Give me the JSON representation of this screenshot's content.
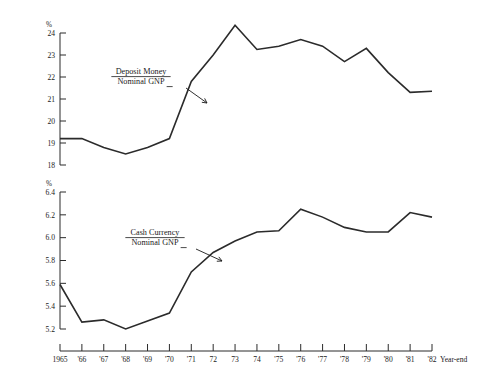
{
  "figure": {
    "x_axis_caption": "Year-end",
    "x_tick_labels": [
      "1965",
      "'66",
      "'67",
      "'68",
      "'69",
      "'70",
      "'71",
      "72",
      "73",
      "74",
      "'75",
      "'76",
      "'77",
      "'78",
      "'79",
      "'80",
      "'81",
      "'82"
    ],
    "ink_color": "#2b2b2b",
    "background_color": "#ffffff"
  },
  "chart_data": [
    {
      "type": "line",
      "title": "",
      "panel": "top",
      "annotation_numerator": "Deposit Money",
      "annotation_denominator": "Nominal GNP",
      "unit_label": "%",
      "xlabel": "Year-end",
      "ylabel": "%",
      "ylim": [
        18,
        24
      ],
      "ytick_labels": [
        "18",
        "19",
        "20",
        "21",
        "22",
        "23",
        "24"
      ],
      "yticks": [
        18,
        19,
        20,
        21,
        22,
        23,
        24
      ],
      "grid": false,
      "legend": "annotation-with-arrow",
      "categories": [
        "1965",
        "'66",
        "'67",
        "'68",
        "'69",
        "'70",
        "'71",
        "72",
        "73",
        "74",
        "'75",
        "'76",
        "'77",
        "'78",
        "'79",
        "'80",
        "'81",
        "'82"
      ],
      "x": [
        1965,
        1966,
        1967,
        1968,
        1969,
        1970,
        1971,
        1972,
        1973,
        1974,
        1975,
        1976,
        1977,
        1978,
        1979,
        1980,
        1981,
        1982
      ],
      "values": [
        19.2,
        19.2,
        18.8,
        18.5,
        18.8,
        19.2,
        21.8,
        23.0,
        24.35,
        23.25,
        23.4,
        23.7,
        23.4,
        22.7,
        23.3,
        22.2,
        21.3,
        21.35
      ]
    },
    {
      "type": "line",
      "title": "",
      "panel": "bottom",
      "annotation_numerator": "Cash Currency",
      "annotation_denominator": "Nominal GNP",
      "unit_label": "%",
      "xlabel": "Year-end",
      "ylabel": "%",
      "ylim": [
        5.2,
        6.4
      ],
      "ytick_labels": [
        "5.2",
        "5.4",
        "5.6",
        "5.8",
        "6.0",
        "6.2",
        "6.4"
      ],
      "yticks": [
        5.2,
        5.4,
        5.6,
        5.8,
        6.0,
        6.2,
        6.4
      ],
      "grid": false,
      "legend": "annotation-with-arrow",
      "categories": [
        "1965",
        "'66",
        "'67",
        "'68",
        "'69",
        "'70",
        "'71",
        "72",
        "73",
        "74",
        "'75",
        "'76",
        "'77",
        "'78",
        "'79",
        "'80",
        "'81",
        "'82"
      ],
      "x": [
        1965,
        1966,
        1967,
        1968,
        1969,
        1970,
        1971,
        1972,
        1973,
        1974,
        1975,
        1976,
        1977,
        1978,
        1979,
        1980,
        1981,
        1982
      ],
      "values": [
        5.59,
        5.26,
        5.28,
        5.2,
        5.27,
        5.34,
        5.7,
        5.87,
        5.97,
        6.05,
        6.06,
        6.25,
        6.18,
        6.09,
        6.05,
        6.05,
        6.22,
        6.18
      ]
    }
  ]
}
